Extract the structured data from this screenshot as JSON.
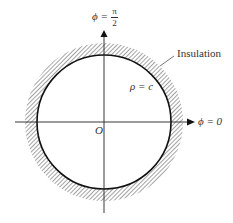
{
  "diagram": {
    "labels": {
      "top_axis_lhs": "ϕ =",
      "top_axis_num": "π",
      "top_axis_den": "2",
      "right_axis": "ϕ = 0",
      "origin": "O",
      "radius": "ρ = c",
      "insulation": "Insulation"
    },
    "geometry": {
      "center": [
        104,
        122
      ],
      "inner_radius": 67,
      "outer_radius": 79
    },
    "colors": {
      "line": "#111111",
      "hatch": "#555555"
    }
  }
}
